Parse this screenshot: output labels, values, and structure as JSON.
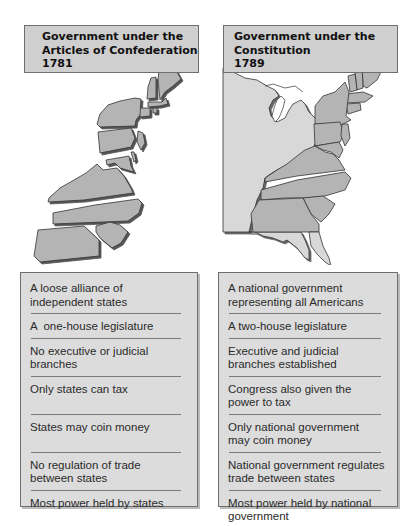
{
  "left_panel": {
    "title_lines": [
      "Government under the",
      "Articles of Confederation",
      "1781"
    ],
    "map_label": "separated-states-map",
    "items": [
      {
        "text": "A loose alliance of independent states",
        "lines": [
          "A loose alliance of",
          "independent states"
        ]
      },
      {
        "text": "A one-house legislature",
        "lines": [
          "A  one-house legislature"
        ]
      },
      {
        "text": "No executive or judicial branches",
        "lines": [
          "No executive or judicial",
          "branches"
        ]
      },
      {
        "text": "Only states can tax",
        "lines": [
          "Only states can tax",
          ""
        ]
      },
      {
        "text": "States may coin money",
        "lines": [
          "States may coin money",
          ""
        ]
      },
      {
        "text": "No regulation of trade between states",
        "lines": [
          "No regulation of trade",
          "between states"
        ]
      },
      {
        "text": "Most power held by states",
        "lines": [
          "Most power held by states"
        ]
      }
    ]
  },
  "right_panel": {
    "title_lines": [
      "Government under the",
      "Constitution",
      "1789"
    ],
    "map_label": "united-states-map",
    "items": [
      {
        "text": "A national government representing all Americans",
        "lines": [
          "A national government",
          "representing all Americans"
        ]
      },
      {
        "text": "A two-house legislature",
        "lines": [
          "A two-house legislature"
        ]
      },
      {
        "text": "Executive and judicial branches established",
        "lines": [
          "Executive and judicial",
          "branches established"
        ]
      },
      {
        "text": "Congress also given the power to tax",
        "lines": [
          "Congress also given the",
          "power to tax"
        ]
      },
      {
        "text": "Only national government may coin money",
        "lines": [
          "Only national government",
          "may coin money"
        ]
      },
      {
        "text": "National government regulates trade between states",
        "lines": [
          "National government regulates",
          "trade between states"
        ]
      },
      {
        "text": "Most power held by national government",
        "lines": [
          "Most power held by national",
          "government"
        ]
      }
    ]
  },
  "colors": {
    "title_bg": "#cfcfcf",
    "list_bg": "#dcdcdc",
    "border": "#6e6e6e",
    "state_fill": "#b4b4b4",
    "land_fill": "#d8d8d8",
    "outline": "#333333"
  }
}
